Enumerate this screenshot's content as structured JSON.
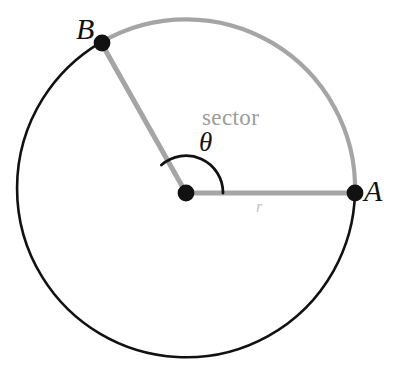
{
  "figure": {
    "background_color": "#ffffff",
    "width": 396,
    "height": 385
  },
  "geometry": {
    "center": {
      "x": 186,
      "y": 193
    },
    "radius": 169,
    "point_A": {
      "x": 355,
      "y": 193,
      "angle_deg": 0
    },
    "point_B": {
      "x": 102,
      "y": 43,
      "angle_deg": 131
    },
    "sector_angle_deg": 131,
    "angle_arc_radius": 37,
    "dot_radius": 8
  },
  "colors": {
    "circle_remainder_stroke": "#111111",
    "sector_arc_stroke": "#a5a5a5",
    "radius_line_stroke": "#a5a5a5",
    "angle_arc_stroke": "#111111",
    "vertex_dot_fill": "#111111",
    "sector_text": "#9c9c9c",
    "theta_text": "#131313",
    "radius_text": "#c2c2c2"
  },
  "labels": {
    "point_a": "A",
    "point_b": "B",
    "sector": "sector",
    "theta": "θ",
    "radius": "r"
  }
}
